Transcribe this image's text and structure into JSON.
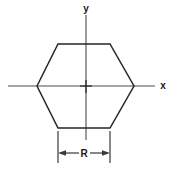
{
  "figure": {
    "background_color": "#ffffff",
    "width": 172,
    "height": 176
  },
  "axes": {
    "x_label": "x",
    "y_label": "y",
    "line_color": "#4c4c4c",
    "origin": {
      "x": 86,
      "y": 86
    },
    "x_extent": {
      "start": 8,
      "end": 155
    },
    "y_extent": {
      "start": 15,
      "end": 140
    }
  },
  "shape": {
    "name": "hexagon",
    "sides": 6,
    "orientation": "flat-top",
    "stroke_color": "#262626",
    "vertices": [
      {
        "x": 37,
        "y": 86
      },
      {
        "x": 58,
        "y": 44
      },
      {
        "x": 110,
        "y": 44
      },
      {
        "x": 134,
        "y": 86
      },
      {
        "x": 110,
        "y": 128
      },
      {
        "x": 58,
        "y": 128
      }
    ]
  },
  "dimension": {
    "label": "R",
    "line_color": "#3a3a3a",
    "left_x": 58,
    "right_x": 110,
    "line_y": 153,
    "extension_top_y": 128,
    "extension_bottom_y": 163,
    "arrow_direction": "both"
  }
}
